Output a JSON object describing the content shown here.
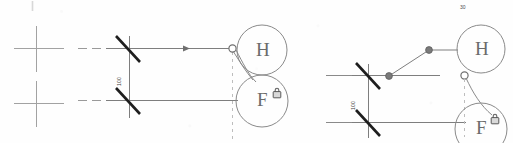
{
  "document": {
    "title": "Two-panel electrical schematic fragment",
    "background_color": "#fefefe",
    "width": 513,
    "height": 143
  },
  "palette": {
    "thin_line": "#8c8c8c",
    "medium_line": "#6f6f6f",
    "switch_bar": "#1e1e1e",
    "node_fill": "#7a7a7a",
    "circle_stroke": "#8a8a8a",
    "dashed_line": "#b0b0b0",
    "glyph_color": "#6b6b6b",
    "text_color": "#3a3a3a",
    "registration_mark": "#9d9d9d"
  },
  "panels": [
    {
      "id": "left-panel",
      "name": "left-schematic",
      "registration_marks": [
        {
          "name": "crosshair-upper",
          "x": 36,
          "y": 48
        },
        {
          "name": "crosshair-lower",
          "x": 36,
          "y": 103
        }
      ],
      "corner_tick": {
        "name": "corner-tick-mark",
        "x": 32,
        "y": 2,
        "text": ""
      },
      "dimension_label": {
        "name": "dimension-label-left",
        "text": "100",
        "x": 113,
        "y": 84,
        "rotation_deg": -90
      },
      "switches": [
        {
          "name": "switch-upper-left",
          "x": 122,
          "y": 48
        },
        {
          "name": "switch-lower-left",
          "x": 122,
          "y": 100
        }
      ],
      "bus_lines": [
        {
          "name": "bus-upper-left",
          "x1": 80,
          "y1": 48,
          "x2": 104,
          "y2": 48,
          "dashed": true
        },
        {
          "name": "bus-lower-left",
          "x1": 80,
          "y1": 100,
          "x2": 104,
          "y2": 100,
          "dashed": true
        }
      ],
      "arrow_marker": {
        "name": "flow-arrow-left",
        "x": 187,
        "y": 48,
        "direction": "right"
      },
      "terminals": [
        {
          "name": "terminal-node-h-left",
          "x": 232,
          "y": 48,
          "style": "open-circle"
        }
      ],
      "dashed_guide": {
        "name": "dashed-guide-left",
        "x": 232,
        "y1": 48,
        "y2": 140
      },
      "devices": [
        {
          "name": "device-circle-h-left",
          "label": "H",
          "cx": 262,
          "cy": 50,
          "r": 25,
          "locked": false
        },
        {
          "name": "device-circle-f-left",
          "label": "F",
          "cx": 262,
          "cy": 100,
          "r": 26,
          "locked": true,
          "lock_icon": {
            "name": "lock-icon-left",
            "x": 273,
            "y": 88
          }
        }
      ]
    },
    {
      "id": "right-panel",
      "name": "right-schematic",
      "corner_tick": {
        "name": "corner-tick-mark-right",
        "x": 462,
        "y": 8,
        "text": "30"
      },
      "dimension_label": {
        "name": "dimension-label-right",
        "text": "100",
        "x": 347,
        "y": 108,
        "rotation_deg": -90
      },
      "switches": [
        {
          "name": "switch-upper-right",
          "x": 363,
          "y": 75
        },
        {
          "name": "switch-lower-right",
          "x": 363,
          "y": 122
        }
      ],
      "bus_lines": [
        {
          "name": "bus-upper-right",
          "x1": 328,
          "y1": 75,
          "x2": 352,
          "y2": 75,
          "dashed": false
        },
        {
          "name": "bus-lower-right",
          "x1": 328,
          "y1": 122,
          "x2": 352,
          "y2": 122,
          "dashed": false
        }
      ],
      "nodes": [
        {
          "name": "node-pivot-lower-right",
          "x": 389,
          "y": 76,
          "style": "filled-circle"
        },
        {
          "name": "node-pivot-upper-right",
          "x": 429,
          "y": 50,
          "style": "filled-circle"
        },
        {
          "name": "terminal-node-f-right",
          "x": 464,
          "y": 75,
          "style": "open-circle"
        }
      ],
      "dashed_guide": {
        "name": "dashed-guide-right",
        "x": 464,
        "y1": 78,
        "y2": 135
      },
      "devices": [
        {
          "name": "device-circle-h-right",
          "label": "H",
          "cx": 481,
          "cy": 49,
          "r": 24,
          "locked": false
        },
        {
          "name": "device-circle-f-right",
          "label": "F",
          "cx": 481,
          "cy": 128,
          "r": 26,
          "locked": true,
          "lock_icon": {
            "name": "lock-icon-right",
            "x": 491,
            "y": 114
          }
        }
      ]
    }
  ],
  "glyph_labels": {
    "h_left": "H",
    "f_left": "F",
    "h_right": "H",
    "f_right": "F"
  },
  "dimension_texts": {
    "left": "100",
    "right": "100"
  },
  "corner_texts": {
    "left": "",
    "right": "30"
  }
}
